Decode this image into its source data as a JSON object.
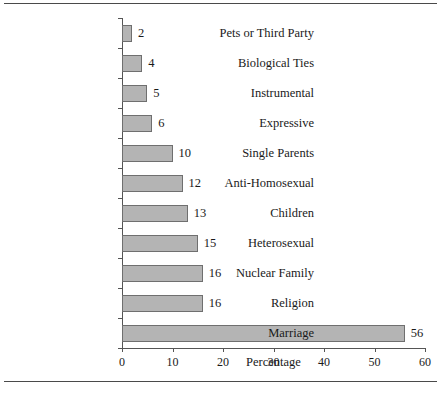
{
  "chart_data": {
    "type": "bar",
    "orientation": "horizontal",
    "title": "",
    "xlabel": "Percentage",
    "ylabel": "",
    "xlim": [
      0,
      60
    ],
    "xticks": [
      0,
      10,
      20,
      30,
      40,
      50,
      60
    ],
    "grid": false,
    "legend": false,
    "bar_color": "#b4b4b4",
    "bar_edge_color": "#6f6f6f",
    "categories": [
      "Pets or Third Party",
      "Biological Ties",
      "Instrumental",
      "Expressive",
      "Single Parents",
      "Anti-Homosexual",
      "Children",
      "Heterosexual",
      "Nuclear Family",
      "Religion",
      "Marriage"
    ],
    "values": [
      2,
      4,
      5,
      6,
      10,
      12,
      13,
      15,
      16,
      16,
      56
    ],
    "value_labels": [
      "2",
      "4",
      "5",
      "6",
      "10",
      "12",
      "13",
      "15",
      "16",
      "16",
      "56"
    ]
  }
}
